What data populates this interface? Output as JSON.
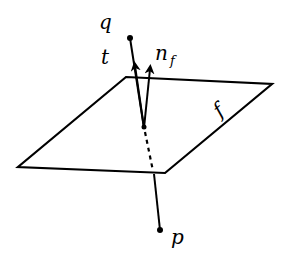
{
  "diagram": {
    "labels": {
      "q": "q",
      "t": "t",
      "n": "n",
      "n_sub": "f",
      "f": "f",
      "p": "p"
    },
    "colors": {
      "stroke": "#000000",
      "background": "#ffffff"
    },
    "points": {
      "q": [
        130,
        38
      ],
      "p": [
        160,
        230
      ],
      "intersection": [
        144,
        128
      ],
      "t_tip": [
        134,
        63
      ],
      "n_f_tip": [
        150,
        66
      ]
    },
    "plane_corners": [
      [
        126,
        77
      ],
      [
        272,
        84
      ],
      [
        165,
        173
      ],
      [
        18,
        167
      ]
    ]
  }
}
